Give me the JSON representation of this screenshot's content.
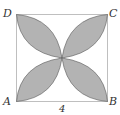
{
  "diagram": {
    "vertices": {
      "A": "A",
      "B": "B",
      "C": "C",
      "D": "D"
    },
    "side_label": "4",
    "colors": {
      "fill": "#b3b3b3",
      "stroke": "#555555",
      "square_stroke": "#bfbfbf"
    }
  }
}
